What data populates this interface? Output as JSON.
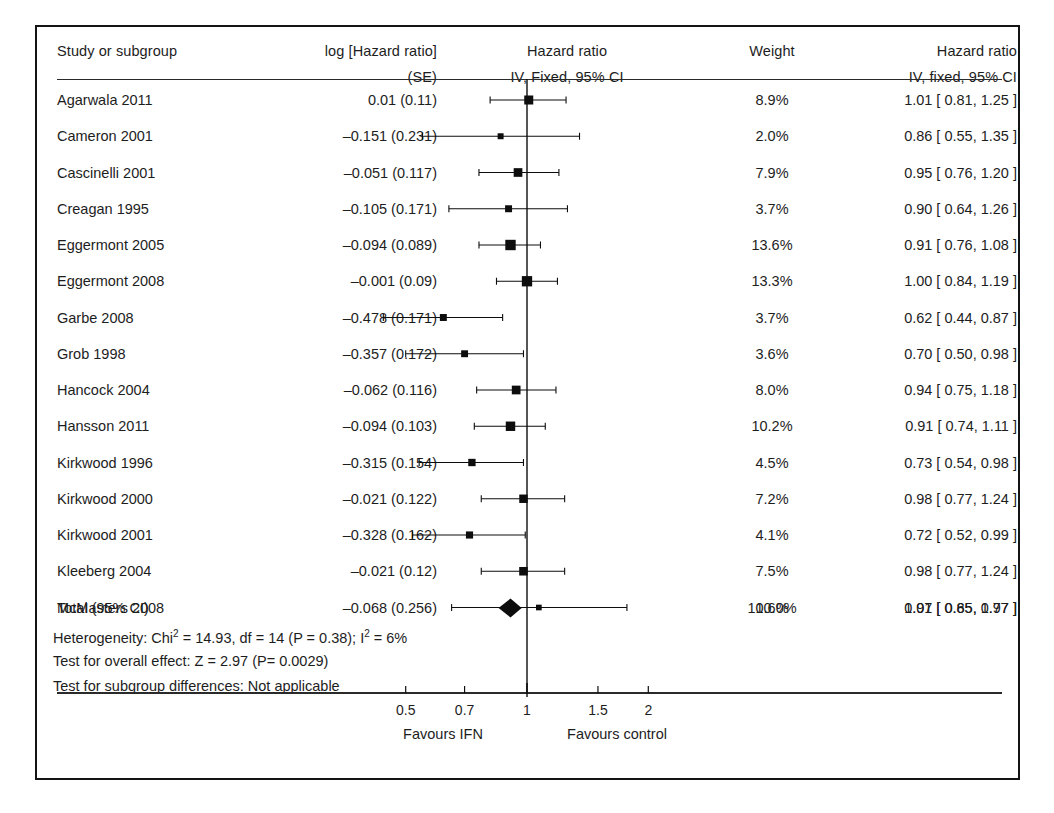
{
  "figure": {
    "type": "forest-plot",
    "columns": {
      "study": {
        "line1": "Study or subgroup",
        "line2": ""
      },
      "log_hr": {
        "line1": "log [Hazard ratio]",
        "line2": "(SE)"
      },
      "plot": {
        "line1": "Hazard ratio",
        "line2": "IV, Fixed, 95% CI"
      },
      "weight": {
        "line1": "Weight",
        "line2": ""
      },
      "hr": {
        "line1": "Hazard ratio",
        "line2": "IV, fixed, 95% CI"
      }
    },
    "total": {
      "label": "Total (95% CI)",
      "weight": "100.0%",
      "hr": "0.91 [ 0.85, 0.97 ]"
    },
    "stats": [
      "Heterogeneity: Chi² = 14.93, df = 14 (P = 0.38); I² = 6%",
      "Test for overall effect: Z = 2.97 (P= 0.0029)",
      "Test for subgroup differences: Not applicable"
    ],
    "axis": {
      "ticks": [
        "0.5",
        "0.7",
        "1",
        "1.5",
        "2"
      ],
      "left_label": "Favours IFN",
      "right_label": "Favours control"
    }
  },
  "chart_data": {
    "type": "forest",
    "title": "Hazard ratio",
    "subtitle": "IV, Fixed, 95% CI",
    "xlabel": "",
    "ylabel": "",
    "scale": "log",
    "xlim": [
      0.4,
      2.2
    ],
    "xticks": [
      0.5,
      0.7,
      1.0,
      1.5,
      2.0
    ],
    "xtick_labels": [
      "0.5",
      "0.7",
      "1",
      "1.5",
      "2"
    ],
    "null_line": 1.0,
    "grid": false,
    "legend": "none",
    "left_annotation": "Favours IFN",
    "right_annotation": "Favours control",
    "columns": [
      "Study or subgroup",
      "log [Hazard ratio] (SE)",
      "Hazard ratio IV, Fixed, 95% CI",
      "Weight",
      "Hazard ratio IV, fixed, 95% CI"
    ],
    "studies": [
      {
        "study": "Agarwala 2011",
        "log_hr_se": "0.01 (0.11)",
        "log_hr": 0.01,
        "se": 0.11,
        "weight": "8.9%",
        "weight_value": 8.9,
        "hr_text": "1.01 [ 0.81, 1.25 ]",
        "hr": 1.01,
        "ci_low": 0.81,
        "ci_high": 1.25
      },
      {
        "study": "Cameron 2001",
        "log_hr_se": "–0.151 (0.231)",
        "log_hr": -0.151,
        "se": 0.231,
        "weight": "2.0%",
        "weight_value": 2.0,
        "hr_text": "0.86 [ 0.55, 1.35 ]",
        "hr": 0.86,
        "ci_low": 0.55,
        "ci_high": 1.35
      },
      {
        "study": "Cascinelli 2001",
        "log_hr_se": "–0.051 (0.117)",
        "log_hr": -0.051,
        "se": 0.117,
        "weight": "7.9%",
        "weight_value": 7.9,
        "hr_text": "0.95 [ 0.76, 1.20 ]",
        "hr": 0.95,
        "ci_low": 0.76,
        "ci_high": 1.2
      },
      {
        "study": "Creagan 1995",
        "log_hr_se": "–0.105 (0.171)",
        "log_hr": -0.105,
        "se": 0.171,
        "weight": "3.7%",
        "weight_value": 3.7,
        "hr_text": "0.90 [ 0.64, 1.26 ]",
        "hr": 0.9,
        "ci_low": 0.64,
        "ci_high": 1.26
      },
      {
        "study": "Eggermont 2005",
        "log_hr_se": "–0.094 (0.089)",
        "log_hr": -0.094,
        "se": 0.089,
        "weight": "13.6%",
        "weight_value": 13.6,
        "hr_text": "0.91 [ 0.76, 1.08 ]",
        "hr": 0.91,
        "ci_low": 0.76,
        "ci_high": 1.08
      },
      {
        "study": "Eggermont 2008",
        "log_hr_se": "–0.001 (0.09)",
        "log_hr": -0.001,
        "se": 0.09,
        "weight": "13.3%",
        "weight_value": 13.3,
        "hr_text": "1.00 [ 0.84, 1.19 ]",
        "hr": 1.0,
        "ci_low": 0.84,
        "ci_high": 1.19
      },
      {
        "study": "Garbe 2008",
        "log_hr_se": "–0.478 (0.171)",
        "log_hr": -0.478,
        "se": 0.171,
        "weight": "3.7%",
        "weight_value": 3.7,
        "hr_text": "0.62 [ 0.44, 0.87 ]",
        "hr": 0.62,
        "ci_low": 0.44,
        "ci_high": 0.87
      },
      {
        "study": "Grob 1998",
        "log_hr_se": "–0.357 (0.172)",
        "log_hr": -0.357,
        "se": 0.172,
        "weight": "3.6%",
        "weight_value": 3.6,
        "hr_text": "0.70 [ 0.50, 0.98 ]",
        "hr": 0.7,
        "ci_low": 0.5,
        "ci_high": 0.98
      },
      {
        "study": "Hancock 2004",
        "log_hr_se": "–0.062 (0.116)",
        "log_hr": -0.062,
        "se": 0.116,
        "weight": "8.0%",
        "weight_value": 8.0,
        "hr_text": "0.94 [ 0.75, 1.18 ]",
        "hr": 0.94,
        "ci_low": 0.75,
        "ci_high": 1.18
      },
      {
        "study": "Hansson 2011",
        "log_hr_se": "–0.094 (0.103)",
        "log_hr": -0.094,
        "se": 0.103,
        "weight": "10.2%",
        "weight_value": 10.2,
        "hr_text": "0.91 [ 0.74, 1.11 ]",
        "hr": 0.91,
        "ci_low": 0.74,
        "ci_high": 1.11
      },
      {
        "study": "Kirkwood 1996",
        "log_hr_se": "–0.315 (0.154)",
        "log_hr": -0.315,
        "se": 0.154,
        "weight": "4.5%",
        "weight_value": 4.5,
        "hr_text": "0.73 [ 0.54, 0.98 ]",
        "hr": 0.73,
        "ci_low": 0.54,
        "ci_high": 0.98
      },
      {
        "study": "Kirkwood 2000",
        "log_hr_se": "–0.021 (0.122)",
        "log_hr": -0.021,
        "se": 0.122,
        "weight": "7.2%",
        "weight_value": 7.2,
        "hr_text": "0.98 [ 0.77, 1.24 ]",
        "hr": 0.98,
        "ci_low": 0.77,
        "ci_high": 1.24
      },
      {
        "study": "Kirkwood 2001",
        "log_hr_se": "–0.328 (0.162)",
        "log_hr": -0.328,
        "se": 0.162,
        "weight": "4.1%",
        "weight_value": 4.1,
        "hr_text": "0.72 [ 0.52, 0.99 ]",
        "hr": 0.72,
        "ci_low": 0.52,
        "ci_high": 0.99
      },
      {
        "study": "Kleeberg 2004",
        "log_hr_se": "–0.021 (0.12)",
        "log_hr": -0.021,
        "se": 0.12,
        "weight": "7.5%",
        "weight_value": 7.5,
        "hr_text": "0.98 [ 0.77, 1.24 ]",
        "hr": 0.98,
        "ci_low": 0.77,
        "ci_high": 1.24
      },
      {
        "study": "McMasters 2008",
        "log_hr_se": "–0.068 (0.256)",
        "log_hr": -0.068,
        "se": 0.256,
        "weight": "1.6%",
        "weight_value": 1.6,
        "hr_text": "1.07 [ 0.65, 1.77 ]",
        "hr": 1.07,
        "ci_low": 0.65,
        "ci_high": 1.77
      }
    ],
    "pooled": {
      "label": "Total (95% CI)",
      "hr": 0.91,
      "ci_low": 0.85,
      "ci_high": 0.97,
      "hr_text": "0.91 [ 0.85, 0.97 ]",
      "weight": "100.0%"
    },
    "annotations": {
      "heterogeneity": "Heterogeneity: Chi² = 14.93, df = 14 (P = 0.38); I² = 6%",
      "overall_effect": "Test for overall effect: Z = 2.97 (P= 0.0029)",
      "subgroup": "Test for subgroup differences: Not applicable"
    }
  },
  "colors": {
    "ink": "#1a1a1a",
    "rule": "#2a2a2a",
    "marker": "#0d0d0d",
    "background": "#ffffff"
  }
}
